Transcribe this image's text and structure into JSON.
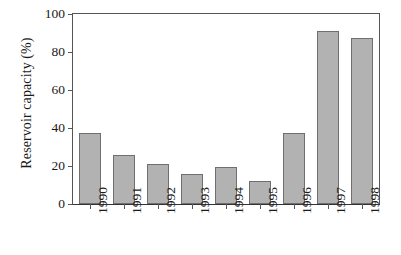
{
  "chart_data": {
    "type": "bar",
    "title": "",
    "subtitle": "",
    "xlabel": "",
    "ylabel": "Reservoir capacity (%)",
    "categories": [
      "1990",
      "1991",
      "1992",
      "1993",
      "1994",
      "1995",
      "1996",
      "1997",
      "1998"
    ],
    "values": [
      37.5,
      26,
      21,
      16,
      19.5,
      12,
      37.5,
      91,
      87.5
    ],
    "series": [
      {
        "name": "Reservoir capacity",
        "values": [
          37.5,
          26,
          21,
          16,
          19.5,
          12,
          37.5,
          91,
          87.5
        ]
      }
    ],
    "ylim": [
      0,
      100
    ],
    "yticks": [
      0,
      20,
      40,
      60,
      80,
      100
    ],
    "ytick_labels": [
      "0",
      "20",
      "40",
      "60",
      "80",
      "100"
    ],
    "grid": false,
    "legend": false,
    "legend_position": "none",
    "annotations": [],
    "bar_fill_color": "#b2b2b2",
    "bar_edge_color": "#6f6f6f",
    "axis_color": "#555555",
    "text_color": "#1a1a1a",
    "background_color": "#ffffff"
  }
}
